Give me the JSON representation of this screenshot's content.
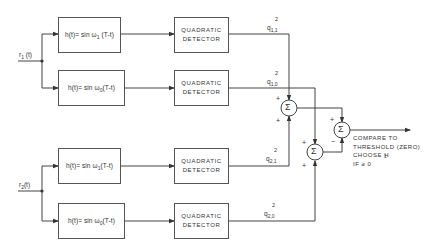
{
  "diagram": {
    "inputs": [
      {
        "label": "r",
        "sub": "1",
        "suffix": " (t)"
      },
      {
        "label": "r",
        "sub": "2",
        "suffix": "(t)"
      }
    ],
    "filters": [
      {
        "pre": "h(t)= sin ω",
        "sub": "1",
        "post": " (T-t)"
      },
      {
        "pre": "h(t)= sin ω",
        "sub": "0",
        "post": "(T-t)"
      },
      {
        "pre": "h(t)= sin ω",
        "sub": "1",
        "post": "(T-t)"
      },
      {
        "pre": "h(t)= sin ω",
        "sub": "0",
        "post": "(T-t)"
      }
    ],
    "detectors": [
      {
        "line1": "QUADRATIC",
        "line2": "DETECTOR"
      },
      {
        "line1": "QUADRATIC",
        "line2": "DETECTOR"
      },
      {
        "line1": "QUADRATIC",
        "line2": "DETECTOR"
      },
      {
        "line1": "QUADRATIC",
        "line2": "DETECTOR"
      }
    ],
    "outputs": [
      {
        "label": "q",
        "sub": "1,1",
        "sup": "2"
      },
      {
        "label": "q",
        "sub": "1,0",
        "sup": "2"
      },
      {
        "label": "q",
        "sub": "2,1",
        "sup": "2"
      },
      {
        "label": "q",
        "sub": "2,0",
        "sup": "2"
      }
    ],
    "summers": [
      {
        "symbol": "Σ",
        "top_sign": "+",
        "bottom_sign": "+"
      },
      {
        "symbol": "Σ",
        "top_sign": "+",
        "bottom_sign": "+"
      },
      {
        "symbol": "Σ",
        "top_sign": "+",
        "bottom_sign": "−"
      }
    ],
    "decision_note": "COMPARE TO\nTHRESHOLD (ZERO)\nCHOOSE H\nIF ≥ 0",
    "decision_sub": "1"
  }
}
